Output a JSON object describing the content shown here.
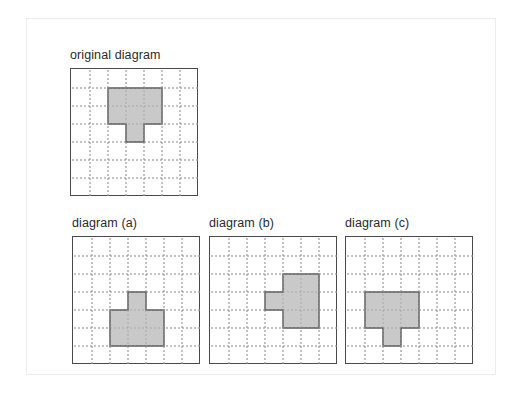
{
  "figure": {
    "background_color": "#ffffff",
    "frame_color": "#ececec",
    "grid_border_color": "#4a4a4a",
    "grid_line_color": "#9a9a9a",
    "shape_fill_color": "#c9c9c9",
    "shape_stroke_color": "#5a5a5a",
    "grid_columns": 7,
    "grid_rows": 7,
    "cell_size": 18
  },
  "panels": [
    {
      "id": "original",
      "label": "original diagram",
      "x": 70,
      "y": 68,
      "cells": [
        [
          2,
          1
        ],
        [
          3,
          1
        ],
        [
          4,
          1
        ],
        [
          2,
          2
        ],
        [
          3,
          2
        ],
        [
          4,
          2
        ],
        [
          3,
          3
        ]
      ],
      "description": "inverted T pentomino: 3-wide bar on top two rows with a stem below the middle column"
    },
    {
      "id": "a",
      "label": "diagram (a)",
      "x": 72,
      "y": 236,
      "cells": [
        [
          3,
          3
        ],
        [
          2,
          4
        ],
        [
          3,
          4
        ],
        [
          4,
          4
        ],
        [
          2,
          5
        ],
        [
          3,
          5
        ],
        [
          4,
          5
        ]
      ],
      "description": "upright T: 1-cell stem on top centered above a 3-wide by 2-tall bar"
    },
    {
      "id": "b",
      "label": "diagram (b)",
      "x": 209,
      "y": 236,
      "cells": [
        [
          4,
          2
        ],
        [
          5,
          2
        ],
        [
          3,
          3
        ],
        [
          4,
          3
        ],
        [
          5,
          3
        ],
        [
          4,
          4
        ],
        [
          5,
          4
        ]
      ],
      "description": "rotated T: 2-wide by 3-tall block with a 1-cell stem to the left of the middle row"
    },
    {
      "id": "c",
      "label": "diagram (c)",
      "x": 345,
      "y": 236,
      "cells": [
        [
          1,
          3
        ],
        [
          2,
          3
        ],
        [
          3,
          3
        ],
        [
          1,
          4
        ],
        [
          2,
          4
        ],
        [
          3,
          4
        ],
        [
          2,
          5
        ]
      ],
      "description": "inverted T shifted left: 3-wide bar over two rows with a stem below the middle column"
    }
  ]
}
